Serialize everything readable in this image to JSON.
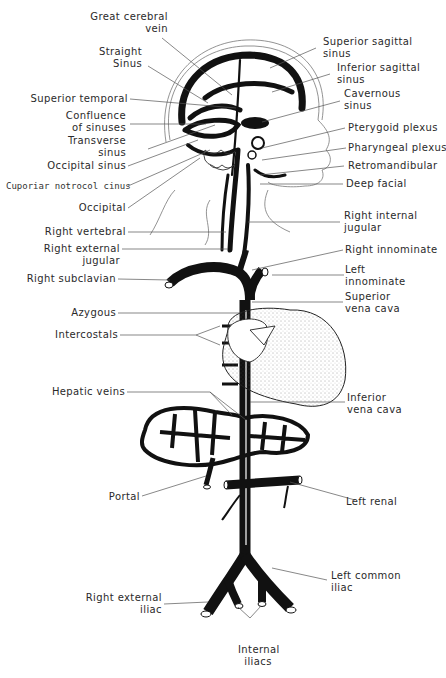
{
  "diagram": {
    "labels_left": [
      {
        "id": "great-cerebral-vein",
        "text": "Great cerebral\nvein",
        "line1": "Great cerebral",
        "line2": "vein"
      },
      {
        "id": "straight-sinus",
        "line1": "Straight",
        "line2": "Sinus"
      },
      {
        "id": "superior-temporal",
        "line1": "Superior temporal"
      },
      {
        "id": "confluence-of-sinuses",
        "line1": "Confluence",
        "line2": "of sinuses"
      },
      {
        "id": "transverse-sinus",
        "line1": "Transverse",
        "line2": "sinus"
      },
      {
        "id": "occipital-sinus",
        "line1": "Occipital sinus"
      },
      {
        "id": "superior-petrosal-sinus",
        "line1": "Cuporiar notrocol cinus"
      },
      {
        "id": "occipital",
        "line1": "Occipital"
      },
      {
        "id": "right-vertebral",
        "line1": "Right vertebral"
      },
      {
        "id": "right-external-jugular",
        "line1": "Right external",
        "line2": "jugular"
      },
      {
        "id": "right-subclavian",
        "line1": "Right subclavian"
      },
      {
        "id": "azygous",
        "line1": "Azygous"
      },
      {
        "id": "intercostals",
        "line1": "Intercostals"
      },
      {
        "id": "hepatic-veins",
        "line1": "Hepatic veins"
      },
      {
        "id": "portal",
        "line1": "Portal"
      },
      {
        "id": "right-external-iliac",
        "line1": "Right external",
        "line2": "iliac"
      }
    ],
    "labels_right": [
      {
        "id": "superior-sagittal-sinus",
        "line1": "Superior sagittal",
        "line2": "sinus"
      },
      {
        "id": "inferior-sagittal-sinus",
        "line1": "Inferior sagittal",
        "line2": "sinus"
      },
      {
        "id": "cavernous-sinus",
        "line1": "Cavernous",
        "line2": "sinus"
      },
      {
        "id": "pterygoid-plexus",
        "line1": "Pterygoid plexus"
      },
      {
        "id": "pharyngeal-plexus",
        "line1": "Pharyngeal plexus"
      },
      {
        "id": "retromandibular",
        "line1": "Retromandibular"
      },
      {
        "id": "deep-facial",
        "line1": "Deep facial"
      },
      {
        "id": "right-internal-jugular",
        "line1": "Right internal",
        "line2": "jugular"
      },
      {
        "id": "right-innominate",
        "line1": "Right innominate"
      },
      {
        "id": "left-innominate",
        "line1": "Left",
        "line2": "innominate"
      },
      {
        "id": "superior-vena-cava",
        "line1": "Superior",
        "line2": "vena cava"
      },
      {
        "id": "inferior-vena-cava",
        "line1": "Inferior",
        "line2": "vena cava"
      },
      {
        "id": "left-renal",
        "line1": "Left renal"
      },
      {
        "id": "left-common-iliac",
        "line1": "Left common",
        "line2": "iliac"
      }
    ],
    "labels_bottom": [
      {
        "id": "internal-iliacs",
        "line1": "Internal",
        "line2": "iliacs"
      }
    ],
    "colors": {
      "ink": "#111111",
      "leader": "#555555",
      "background": "#ffffff"
    }
  }
}
